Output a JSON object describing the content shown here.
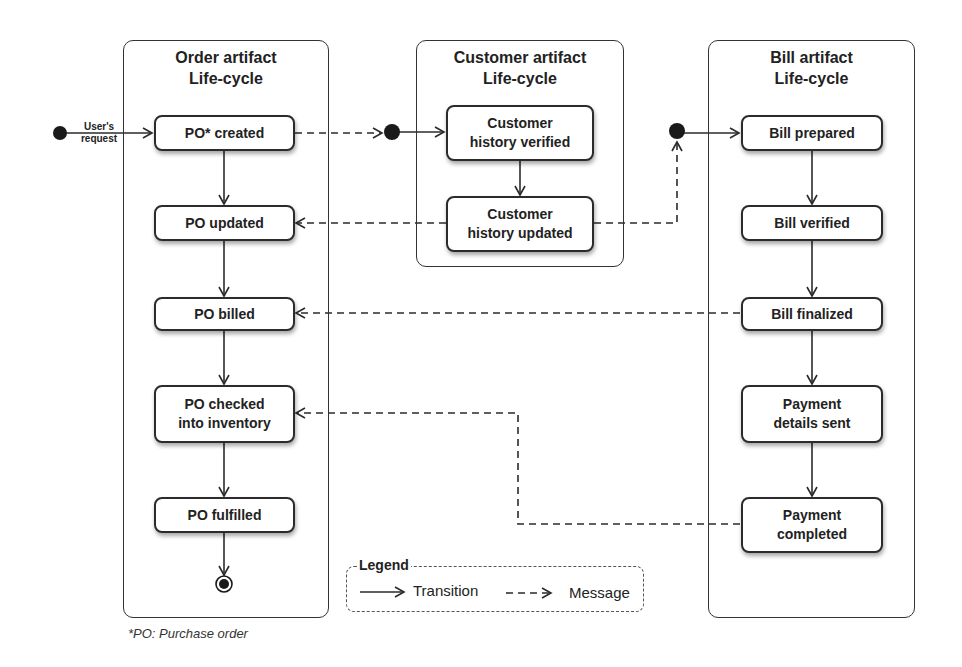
{
  "lanes": {
    "order": {
      "title_line1": "Order artifact",
      "title_line2": "Life-cycle"
    },
    "customer": {
      "title_line1": "Customer artifact",
      "title_line2": "Life-cycle"
    },
    "bill": {
      "title_line1": "Bill artifact",
      "title_line2": "Life-cycle"
    }
  },
  "states": {
    "po_created": "PO* created",
    "po_updated": "PO updated",
    "po_billed": "PO billed",
    "po_checked_1": "PO checked",
    "po_checked_2": "into inventory",
    "po_fulfilled": "PO fulfilled",
    "cust_verified_1": "Customer",
    "cust_verified_2": "history verified",
    "cust_updated_1": "Customer",
    "cust_updated_2": "history updated",
    "bill_prepared": "Bill prepared",
    "bill_verified": "Bill verified",
    "bill_finalized": "Bill finalized",
    "payment_sent_1": "Payment",
    "payment_sent_2": "details sent",
    "payment_completed_1": "Payment",
    "payment_completed_2": "completed"
  },
  "labels": {
    "user_request_1": "User's",
    "user_request_2": "request"
  },
  "legend": {
    "title": "Legend",
    "transition": "Transition",
    "message": "Message"
  },
  "footnote": "*PO: Purchase order",
  "colors": {
    "line": "#2b2b2b",
    "background": "#ffffff"
  }
}
